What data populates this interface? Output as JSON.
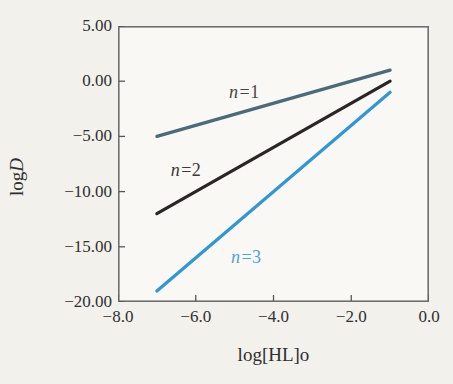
{
  "chart_data": {
    "type": "line",
    "title": "",
    "xlabel": "log[HL]o",
    "ylabel": "logD",
    "ylabel_parts": {
      "prefix": "log",
      "italic": "D"
    },
    "xlim": [
      -8,
      0
    ],
    "ylim": [
      -20,
      5
    ],
    "grid": false,
    "legend_position": "inline-labels",
    "x_ticks": [
      {
        "value": -8,
        "label": "−8.0"
      },
      {
        "value": -6,
        "label": "−6.0"
      },
      {
        "value": -4,
        "label": "−4.0"
      },
      {
        "value": -2,
        "label": "−2.0"
      },
      {
        "value": 0,
        "label": "0.0"
      }
    ],
    "y_ticks": [
      {
        "value": 5,
        "label": "5.00"
      },
      {
        "value": 0,
        "label": "0.00"
      },
      {
        "value": -5,
        "label": "−5.00"
      },
      {
        "value": -10,
        "label": "−10.00"
      },
      {
        "value": -15,
        "label": "−15.00"
      },
      {
        "value": -20,
        "label": "−20.00"
      }
    ],
    "series": [
      {
        "name": "n=1",
        "label_italic": "n",
        "label_rest": "=1",
        "slope": 1,
        "points": [
          [
            -7,
            -5
          ],
          [
            -1,
            1
          ]
        ],
        "color": "#4a6b78",
        "label_pos": [
          -4.75,
          -0.95
        ],
        "label_color": "#45484a"
      },
      {
        "name": "n=2",
        "label_italic": "n",
        "label_rest": "=2",
        "slope": 2,
        "points": [
          [
            -7,
            -12
          ],
          [
            -1,
            0
          ]
        ],
        "color": "#2a2526",
        "label_pos": [
          -6.25,
          -8.0
        ],
        "label_color": "#3a3a3a"
      },
      {
        "name": "n=3",
        "label_italic": "n",
        "label_rest": "=3",
        "slope": 3,
        "points": [
          [
            -7,
            -19
          ],
          [
            -1,
            -1
          ]
        ],
        "color": "#2f97d8",
        "label_pos": [
          -4.7,
          -15.9
        ],
        "label_color": "#4aa3da"
      }
    ],
    "style": {
      "background": "#f2f1ec",
      "plot_background": "#f9f8f4",
      "frame_color": "#6f6f6f",
      "tick_color": "#565656",
      "text_color": "#2f2f2f",
      "line_width": 3.2,
      "tick_length": 6
    }
  }
}
